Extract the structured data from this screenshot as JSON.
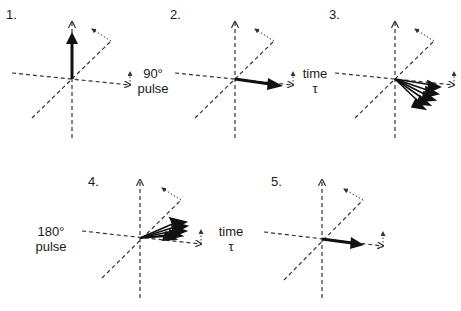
{
  "figure": {
    "panels": [
      {
        "number": "1.",
        "state": "net magnetization along z-axis"
      },
      {
        "number": "2.",
        "state": "magnetization tipped into transverse plane"
      },
      {
        "number": "3.",
        "state": "spins dephasing (fanning out)"
      },
      {
        "number": "4.",
        "state": "spins refocusing after inversion"
      },
      {
        "number": "5.",
        "state": "spins rephased (echo)"
      }
    ],
    "transitions": [
      {
        "line1": "90°",
        "line2": "pulse"
      },
      {
        "line1": "time",
        "line2": "τ"
      },
      {
        "line1": "180°",
        "line2": "pulse"
      },
      {
        "line1": "time",
        "line2": "τ"
      }
    ],
    "colors": {
      "ink": "#1a1a1a",
      "axis": "#333333",
      "background": "#ffffff"
    }
  }
}
